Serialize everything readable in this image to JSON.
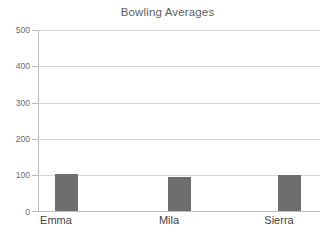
{
  "chart_data": {
    "type": "bar",
    "title": "Bowling Averages",
    "xlabel": "",
    "ylabel": "",
    "categories": [
      "Emma",
      "Mila",
      "Sierra"
    ],
    "values": [
      102,
      93,
      100
    ],
    "series": [
      {
        "name": "Bowling Average",
        "values": [
          102,
          93,
          100
        ]
      }
    ],
    "ylim": [
      0,
      500
    ],
    "ytick_labels": [
      "0",
      "100",
      "200",
      "300",
      "400",
      "500"
    ],
    "ytick_values": [
      0,
      100,
      200,
      300,
      400,
      500
    ],
    "grid": "horizontal",
    "legend": "none",
    "bar_color": "#6e6e6e",
    "gridline_color": "#d4d4d4",
    "axis_color": "#b9b9b9",
    "title_color": "#5d5d5d",
    "tick_label_color": "#6a6a6a",
    "category_label_color": "#3f3f3f",
    "background_color": "#ffffff"
  }
}
